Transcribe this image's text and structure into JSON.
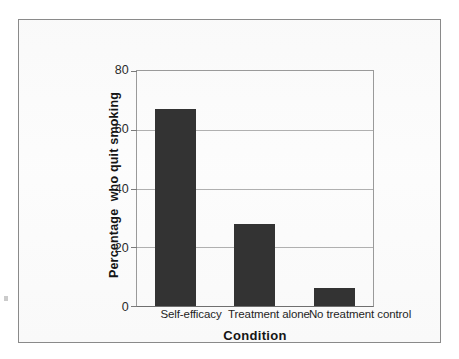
{
  "chart_data": {
    "type": "bar",
    "title": "",
    "subtitle": "",
    "xlabel": "Condition",
    "ylabel": "Percentage  who quit smoking",
    "categories": [
      "Self-efficacy",
      "Treatment alone",
      "No treatment control"
    ],
    "values": [
      67,
      28,
      6
    ],
    "series": [
      {
        "name": "Percentage who quit smoking",
        "values": [
          67,
          28,
          6
        ]
      }
    ],
    "ylim": [
      0,
      80
    ],
    "yticks": [
      0,
      20,
      40,
      60,
      80
    ],
    "ytick_labels": [
      "0",
      "20",
      "40",
      "60",
      "80"
    ],
    "grid": "horizontal",
    "legend": "none",
    "bar_color": "#333333",
    "gridline_color": "#b0b0b0",
    "axis_color": "#6f6f6f",
    "frame_color": "#8a8a8a",
    "background": "#fcfcfc"
  }
}
